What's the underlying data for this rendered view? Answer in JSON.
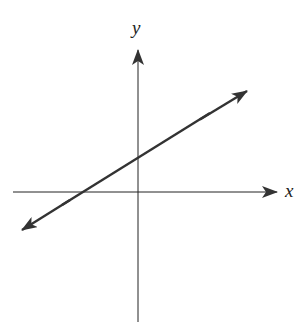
{
  "diagram": {
    "title": "",
    "axes": {
      "x_label": "x",
      "y_label": "y",
      "color": "#222222"
    },
    "line": {
      "description": "Line with positive slope, positive y-intercept, negative x-intercept, arrows on both ends",
      "color": "#333333"
    },
    "colors": {
      "background": "#ffffff",
      "stroke": "#222222"
    }
  }
}
